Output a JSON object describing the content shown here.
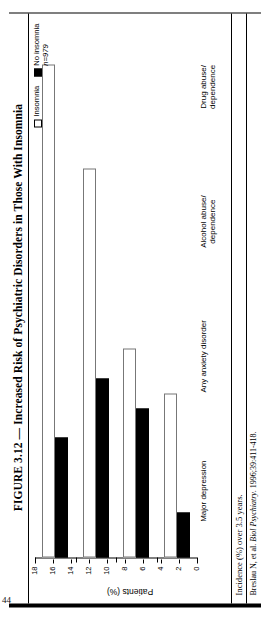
{
  "page_number": "44",
  "figure": {
    "title": "FIGURE 3.12 — Increased Risk of Psychiatric Disorders in Those With Insomnia",
    "note": "Incidence (%) over 3.5 years.",
    "source_prefix": "Breslau N, et al. ",
    "source_italic": "Biol Psychiatry",
    "source_suffix": ". 1996;39:411-418."
  },
  "legend": {
    "items": [
      {
        "label": "Insomnia",
        "nlabel": "",
        "swatch": "open",
        "color": "#ffffff"
      },
      {
        "label": "No insomnia",
        "nlabel": "n=979",
        "swatch": "solid",
        "color": "#000000"
      }
    ]
  },
  "chart_data": {
    "type": "bar",
    "orientation": "vertical",
    "title": "Increased Risk of Psychiatric Disorders in Those With Insomnia",
    "xlabel": "",
    "ylabel": "Patients (%)",
    "ylim": [
      0,
      18
    ],
    "yticks": [
      0,
      2,
      4,
      6,
      8,
      10,
      12,
      14,
      16,
      18
    ],
    "ticklabels": [
      "0",
      "2",
      "4",
      "6",
      "8",
      "10",
      "12",
      "14",
      "16",
      "18"
    ],
    "grid": false,
    "legend_position": "top-right",
    "categories": [
      "Major depression",
      "Any anxiety disorder",
      "Alcohol abuse/ dependence",
      "Drug abuse/ dependence"
    ],
    "category_lines": [
      [
        "Major depression"
      ],
      [
        "Any anxiety disorder"
      ],
      [
        "Alcohol abuse/",
        "dependence"
      ],
      [
        "Drug abuse/",
        "dependence"
      ]
    ],
    "series": [
      {
        "name": "Insomnia",
        "color": "#ffffff",
        "values": [
          16.5,
          13.0,
          7.0,
          5.5
        ]
      },
      {
        "name": "No insomnia",
        "color": "#000000",
        "values": [
          4.0,
          6.0,
          5.0,
          1.5
        ]
      }
    ],
    "annotation": "Incidence (%) over 3.5 years."
  }
}
